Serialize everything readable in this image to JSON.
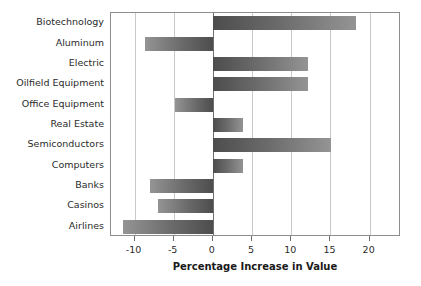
{
  "chart_data": {
    "type": "bar",
    "orientation": "horizontal",
    "title": "",
    "xlabel": "Percentage Increase in Value",
    "ylabel": "",
    "categories": [
      "Biotechnology",
      "Aluminum",
      "Electric",
      "Oilfield Equipment",
      "Office Equipment",
      "Real Estate",
      "Semiconductors",
      "Computers",
      "Banks",
      "Casinos",
      "Airlines"
    ],
    "values": [
      18.3,
      -8.7,
      12.1,
      12.1,
      -4.8,
      3.9,
      15.1,
      3.9,
      -8.0,
      -7.0,
      -11.5
    ],
    "xlim": [
      -13,
      24
    ],
    "xticks": [
      -10,
      -5,
      0,
      5,
      10,
      15,
      20
    ],
    "xticklabels": [
      "-10",
      "-5",
      "0",
      "5",
      "10",
      "15",
      "20"
    ],
    "grid": true,
    "grid_axis": "x",
    "legend": null,
    "bar_color_dark": "#4d4d4d",
    "bar_color_light": "#949494",
    "zero_line_color": "#6e6e6e",
    "gridline_color": "#c9c9c9",
    "frame_color": "#8d8d8d"
  }
}
